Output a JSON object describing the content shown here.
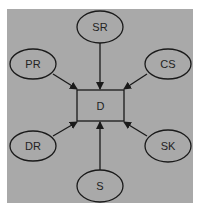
{
  "colors": {
    "background": "#a9a9a9",
    "stroke": "#1a1a1a"
  },
  "center": {
    "label": "D"
  },
  "nodes": [
    {
      "id": "sr",
      "label": "SR"
    },
    {
      "id": "pr",
      "label": "PR"
    },
    {
      "id": "cs",
      "label": "CS"
    },
    {
      "id": "dr",
      "label": "DR"
    },
    {
      "id": "sk",
      "label": "SK"
    },
    {
      "id": "s",
      "label": "S"
    }
  ]
}
